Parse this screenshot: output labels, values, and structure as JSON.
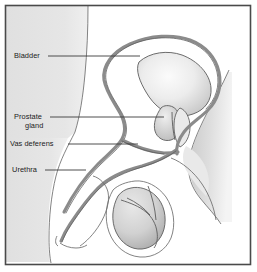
{
  "figure": {
    "view": "side view line drawing with gray shading",
    "frame_color": "#4a4a4a",
    "background_color": "#ffffff",
    "body_shading_color": "#e3e3e3",
    "organ_shading_color": "#d2d2d2",
    "duct_color": "#8b8b8b",
    "outline_color": "#6d6d6d",
    "label_color": "#1b1b1b"
  },
  "labels": [
    {
      "id": "bladder",
      "text": "Bladder",
      "lines": [
        "Bladder"
      ],
      "text_x": 14,
      "text_y": 58,
      "leader_points": "48,56 140,56",
      "points_to": "urinary bladder"
    },
    {
      "id": "prostate-gland",
      "text": "Prostate gland",
      "lines": [
        "Prostate",
        "gland"
      ],
      "text_x": 14,
      "text_y": 119,
      "leader_points": "50,117 164,117",
      "points_to": "prostate gland"
    },
    {
      "id": "vas-deferens",
      "text": "Vas deferens",
      "lines": [
        "Vas deferens"
      ],
      "text_x": 10,
      "text_y": 146,
      "leader_points": "68,144 138,144",
      "points_to": "vas deferens duct"
    },
    {
      "id": "urethra",
      "text": "Urethra",
      "lines": [
        "Urethra"
      ],
      "text_x": 12,
      "text_y": 172,
      "leader_points": "45,170 86,170",
      "points_to": "urethra"
    }
  ],
  "structures": [
    {
      "id": "bladder",
      "name": "Bladder",
      "shaded": true
    },
    {
      "id": "prostate-gland",
      "name": "Prostate gland",
      "shaded": true
    },
    {
      "id": "vas-deferens",
      "name": "Vas deferens",
      "shaded": false
    },
    {
      "id": "urethra",
      "name": "Urethra",
      "shaded": false
    },
    {
      "id": "testicle",
      "name": "Testicle",
      "shaded": true
    },
    {
      "id": "epididymis",
      "name": "Epididymis",
      "shaded": true
    },
    {
      "id": "scrotum",
      "name": "Scrotum",
      "shaded": false
    },
    {
      "id": "penis",
      "name": "Penis",
      "shaded": false
    },
    {
      "id": "sacrum",
      "name": "Sacrum",
      "shaded": true
    }
  ]
}
